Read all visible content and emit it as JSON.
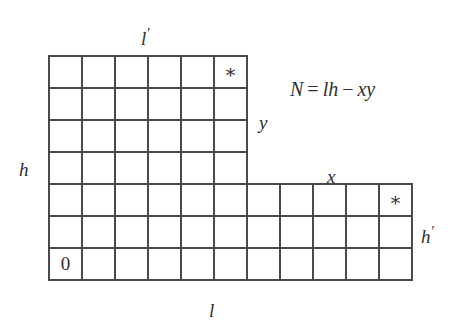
{
  "figure": {
    "kind": "skew-diagram",
    "equation": {
      "lhs": "N",
      "equals": "=",
      "term1": "lh",
      "minus": "−",
      "term2": "xy",
      "full": "N = lh − xy"
    },
    "labels": {
      "top_width": "l",
      "top_width_prime": "′",
      "left_height": "h",
      "inner_height": "y",
      "inner_width": "x",
      "right_height": "h",
      "right_height_prime": "′",
      "bottom_width": "l"
    },
    "cells": {
      "origin_marker": "0",
      "star_marker": "∗"
    },
    "geometry": {
      "cell_width": 33,
      "cell_height": 32,
      "origin_x": 49,
      "origin_y": 56,
      "upper_block_cols": 6,
      "upper_block_rows": 4,
      "lower_block_cols": 11,
      "lower_block_rows": 3,
      "total_rows": 7,
      "star_upper_col": 6,
      "star_upper_row": 1,
      "star_lower_col": 11,
      "star_lower_row": 5,
      "origin_col": 1,
      "origin_row": 7
    },
    "colors": {
      "background": "#ffffff",
      "grid_line": "#565656",
      "outline": "#3d3d3d",
      "text": "#2f2f2f"
    }
  }
}
